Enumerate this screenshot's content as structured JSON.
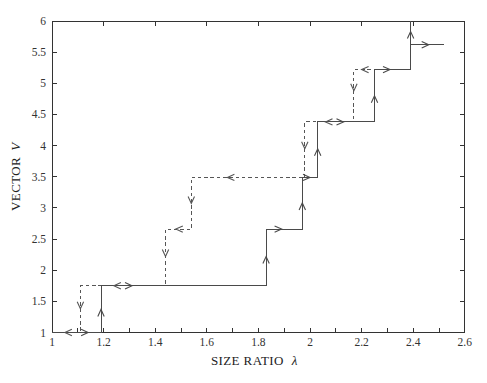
{
  "figure": {
    "background": "#ffffff",
    "axis_color": "#333333",
    "solid_line_color": "#4a4a4a",
    "dashed_line_color": "#565656",
    "tick_label_color": "#333333",
    "axis_label_color": "#222222"
  },
  "chart_data": {
    "type": "line",
    "title": "",
    "xlabel": "SIZE RATIO λ",
    "xlabel_text": "SIZE RATIO",
    "xlabel_symbol": "λ",
    "ylabel": "VECTOR V",
    "ylabel_text": "VECTOR",
    "ylabel_symbol": "V",
    "xlim": [
      1,
      2.6
    ],
    "ylim": [
      1,
      6
    ],
    "x_tick_values": [
      1,
      1.2,
      1.4,
      1.6,
      1.8,
      2,
      2.2,
      2.4,
      2.6
    ],
    "x_tick_labels": [
      "1",
      "1.2",
      "1.4",
      "1.6",
      "1.8",
      "2",
      "2.2",
      "2.4",
      "2.6"
    ],
    "x_minor_tick_step": 0.1,
    "y_tick_values": [
      1,
      1.5,
      2,
      2.5,
      3,
      3.5,
      4,
      4.5,
      5,
      5.5,
      6
    ],
    "y_tick_labels": [
      "1",
      "1.5",
      "2",
      "2.5",
      "3",
      "3.5",
      "4",
      "4.5",
      "5",
      "5.5",
      "6"
    ],
    "grid": false,
    "legend": "none",
    "series": [
      {
        "name": "forward sweep (increasing λ)",
        "style": "solid",
        "points": [
          [
            1,
            1
          ],
          [
            1.19,
            1
          ],
          [
            1.19,
            1.75
          ],
          [
            1.83,
            1.75
          ],
          [
            1.83,
            2.66
          ],
          [
            1.97,
            2.66
          ],
          [
            1.97,
            3.49
          ],
          [
            2.03,
            3.49
          ],
          [
            2.03,
            4.38
          ],
          [
            2.25,
            4.38
          ],
          [
            2.25,
            5.22
          ],
          [
            2.39,
            5.22
          ],
          [
            2.39,
            6
          ]
        ],
        "arrows": [
          {
            "x": 1.14,
            "y": 1,
            "dir": "right"
          },
          {
            "x": 1.19,
            "y": 1.37,
            "dir": "up"
          },
          {
            "x": 1.31,
            "y": 1.75,
            "dir": "right"
          },
          {
            "x": 1.83,
            "y": 2.22,
            "dir": "up"
          },
          {
            "x": 1.89,
            "y": 2.66,
            "dir": "right"
          },
          {
            "x": 1.97,
            "y": 3.08,
            "dir": "up"
          },
          {
            "x": 2.0,
            "y": 3.49,
            "dir": "right"
          },
          {
            "x": 2.03,
            "y": 3.95,
            "dir": "up"
          },
          {
            "x": 2.13,
            "y": 4.38,
            "dir": "right"
          },
          {
            "x": 2.25,
            "y": 4.8,
            "dir": "up"
          },
          {
            "x": 2.31,
            "y": 5.22,
            "dir": "right"
          },
          {
            "x": 2.39,
            "y": 5.83,
            "dir": "up"
          }
        ]
      },
      {
        "name": "forward sweep final branch",
        "style": "solid",
        "points": [
          [
            2.39,
            5.62
          ],
          [
            2.52,
            5.62
          ]
        ],
        "arrows": [
          {
            "x": 2.46,
            "y": 5.62,
            "dir": "right"
          }
        ]
      },
      {
        "name": "backward sweep (decreasing λ)",
        "style": "dashed",
        "points": [
          [
            2.26,
            5.22
          ],
          [
            2.17,
            5.22
          ],
          [
            2.17,
            4.38
          ],
          [
            1.98,
            4.38
          ],
          [
            1.98,
            3.49
          ],
          [
            1.54,
            3.49
          ],
          [
            1.54,
            2.66
          ],
          [
            1.44,
            2.66
          ],
          [
            1.44,
            1.75
          ],
          [
            1.11,
            1.75
          ],
          [
            1.11,
            1
          ],
          [
            1,
            1
          ]
        ],
        "arrows": [
          {
            "x": 2.2,
            "y": 5.22,
            "dir": "left"
          },
          {
            "x": 2.17,
            "y": 4.88,
            "dir": "down"
          },
          {
            "x": 2.06,
            "y": 4.38,
            "dir": "left"
          },
          {
            "x": 1.98,
            "y": 3.95,
            "dir": "down"
          },
          {
            "x": 1.68,
            "y": 3.49,
            "dir": "left"
          },
          {
            "x": 1.54,
            "y": 3.07,
            "dir": "down"
          },
          {
            "x": 1.48,
            "y": 2.66,
            "dir": "left"
          },
          {
            "x": 1.44,
            "y": 2.22,
            "dir": "down"
          },
          {
            "x": 1.24,
            "y": 1.75,
            "dir": "left"
          },
          {
            "x": 1.11,
            "y": 1.38,
            "dir": "down"
          },
          {
            "x": 1.05,
            "y": 1,
            "dir": "left"
          }
        ]
      }
    ]
  }
}
